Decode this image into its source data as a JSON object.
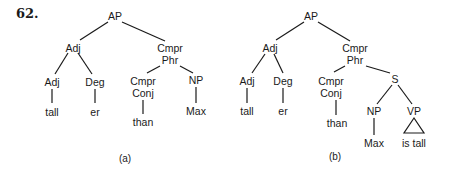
{
  "example_number": "62.",
  "trees": [
    {
      "caption": "(a)",
      "nodes": {
        "root": "AP",
        "adj1": "Adj",
        "cmpr_phr_1": "Cmpr",
        "cmpr_phr_2": "Phr",
        "adj2": "Adj",
        "deg": "Deg",
        "cmpr_conj_1": "Cmpr",
        "cmpr_conj_2": "Conj",
        "np": "NP",
        "tall": "tall",
        "er": "er",
        "than": "than",
        "max": "Max"
      }
    },
    {
      "caption": "(b)",
      "nodes": {
        "root": "AP",
        "adj1": "Adj",
        "cmpr_phr_1": "Cmpr",
        "cmpr_phr_2": "Phr",
        "adj2": "Adj",
        "deg": "Deg",
        "cmpr_conj_1": "Cmpr",
        "cmpr_conj_2": "Conj",
        "s": "S",
        "tall": "tall",
        "er": "er",
        "than": "than",
        "np": "NP",
        "vp": "VP",
        "max": "Max",
        "is_tall": "is tall"
      }
    }
  ],
  "colors": {
    "ink": "#1a1a1a",
    "background": "#ffffff"
  }
}
